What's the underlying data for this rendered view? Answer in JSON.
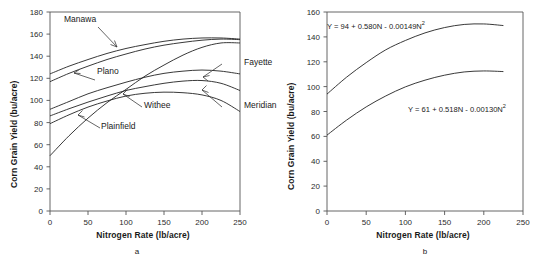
{
  "figure": {
    "panels": [
      {
        "id": "a",
        "caption": "a",
        "ylabel": "Corn Grain Yield (bu/acre)",
        "xlabel": "Nitrogen Rate (lb/acre)"
      },
      {
        "id": "b",
        "caption": "b",
        "ylabel": "Corn Grain Yield (bu/acre)",
        "xlabel": "Nitrogen Rate (lb/acre)"
      }
    ],
    "annotations_a": [
      {
        "name": "manawa",
        "label": "Manawa"
      },
      {
        "name": "plano",
        "label": "Plano"
      },
      {
        "name": "plainfield",
        "label": "Plainfield"
      },
      {
        "name": "withee",
        "label": "Withee"
      },
      {
        "name": "fayette",
        "label": "Fayette"
      },
      {
        "name": "meridian",
        "label": "Meridian"
      }
    ],
    "equations_b": [
      {
        "name": "upper-curve-equation",
        "text": "Y = 94 + 0.580N - 0.00149N",
        "exp": "2"
      },
      {
        "name": "lower-curve-equation",
        "text": "Y = 61 + 0.518N - 0.00130N",
        "exp": "2"
      }
    ]
  },
  "chart_data": [
    {
      "type": "line",
      "panel": "a",
      "title": "",
      "xlabel": "Nitrogen Rate (lb/acre)",
      "ylabel": "Corn Grain Yield (bu/acre)",
      "xlim": [
        0,
        250
      ],
      "ylim": [
        0,
        180
      ],
      "xticks": [
        0,
        50,
        100,
        150,
        200,
        250
      ],
      "yticks": [
        0,
        20,
        40,
        60,
        80,
        100,
        120,
        140,
        160,
        180
      ],
      "grid": false,
      "legend": "inline-annotations",
      "x": [
        0,
        25,
        50,
        75,
        100,
        125,
        150,
        175,
        200,
        225,
        250
      ],
      "series": [
        {
          "name": "Manawa",
          "values": [
            124,
            131,
            137,
            142.5,
            147,
            150.5,
            153.5,
            155.5,
            156.5,
            156.5,
            155.5
          ]
        },
        {
          "name": "Plano",
          "values": [
            117,
            124.5,
            131,
            137,
            142,
            146.5,
            150,
            152.5,
            154.5,
            155.5,
            155
          ]
        },
        {
          "name": "Plainfield",
          "values": [
            50,
            68,
            84,
            98,
            110,
            122,
            132,
            141,
            148,
            152,
            152
          ]
        },
        {
          "name": "Fayette",
          "values": [
            92,
            99,
            106,
            111.5,
            116.5,
            121,
            124.5,
            126.5,
            127.5,
            126.5,
            124
          ]
        },
        {
          "name": "Meridian",
          "values": [
            86,
            92.5,
            98.5,
            104,
            109,
            112.5,
            115.5,
            117.5,
            118,
            115.5,
            109
          ]
        },
        {
          "name": "Withee",
          "values": [
            79,
            87,
            94,
            99.5,
            104,
            106.5,
            107.5,
            107,
            105,
            100,
            90
          ]
        }
      ]
    },
    {
      "type": "line",
      "panel": "b",
      "title": "",
      "xlabel": "Nitrogen Rate (lb/acre)",
      "ylabel": "Corn Grain Yield (bu/acre)",
      "xlim": [
        0,
        250
      ],
      "ylim": [
        0,
        160
      ],
      "xticks": [
        0,
        50,
        100,
        150,
        200,
        250
      ],
      "yticks": [
        0,
        20,
        40,
        60,
        80,
        100,
        120,
        140,
        160
      ],
      "grid": false,
      "legend": "equation-annotations",
      "x": [
        0,
        25,
        50,
        75,
        100,
        125,
        150,
        175,
        200,
        225
      ],
      "series": [
        {
          "name": "Y = 94 + 0.580N - 0.00149N^2",
          "equation": {
            "intercept": 94,
            "linear": 0.58,
            "quadratic": -0.00149
          },
          "values": [
            94,
            107.6,
            119.3,
            129.6,
            137.1,
            143.2,
            147.5,
            150.0,
            150.4,
            149.1
          ]
        },
        {
          "name": "Y = 61 + 0.518N - 0.00130N^2",
          "equation": {
            "intercept": 61,
            "linear": 0.518,
            "quadratic": -0.0013
          },
          "values": [
            61,
            73.1,
            83.7,
            92.5,
            99.8,
            105.2,
            109.2,
            111.8,
            112.6,
            112.1
          ]
        }
      ]
    }
  ]
}
